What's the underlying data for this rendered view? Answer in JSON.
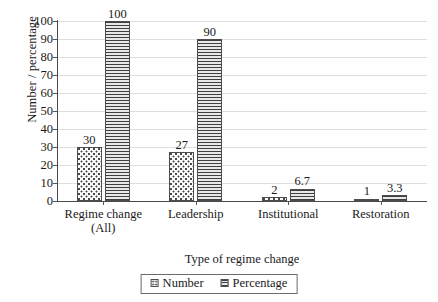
{
  "chart_data": {
    "type": "bar",
    "title": "",
    "xlabel": "Type of regime change",
    "ylabel": "Number / percentage",
    "ylim": [
      0,
      100
    ],
    "yticks": [
      0,
      10,
      20,
      30,
      40,
      50,
      60,
      70,
      80,
      90,
      100
    ],
    "grid": true,
    "legend_position": "bottom",
    "categories": [
      "Regime change (All)",
      "Leadership",
      "Institutional",
      "Restoration"
    ],
    "category_lines": [
      [
        "Regime change",
        "(All)"
      ],
      [
        "Leadership",
        ""
      ],
      [
        "Institutional",
        ""
      ],
      [
        "Restoration",
        ""
      ]
    ],
    "series": [
      {
        "name": "Number",
        "pattern": "dotted",
        "values": [
          30,
          27,
          2,
          1
        ],
        "labels": [
          "30",
          "27",
          "2",
          "1"
        ]
      },
      {
        "name": "Percentage",
        "pattern": "horizontal-lines",
        "values": [
          100,
          90,
          6.7,
          3.3
        ],
        "labels": [
          "100",
          "90",
          "6.7",
          "3.3"
        ]
      }
    ]
  },
  "legend": {
    "items": [
      {
        "label": "Number",
        "swatch": "dotted-swatch-icon"
      },
      {
        "label": "Percentage",
        "swatch": "striped-swatch-icon"
      }
    ]
  },
  "colors": {
    "axis": "#4a4a4a",
    "gridline": "#dededc",
    "bar_outline": "#4d4d4d",
    "percentage_fill": "#b9b9b9",
    "number_fill": "#fbfbfb",
    "text": "#1a1a1a",
    "background": "#ffffff"
  }
}
